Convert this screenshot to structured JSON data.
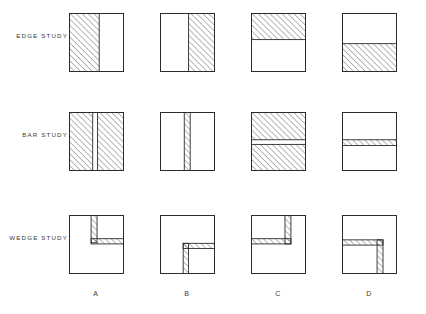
{
  "figure": {
    "title": "",
    "background_color": "#ffffff",
    "line_color": "#2b2b2b",
    "hatch_color": "#4a4a4a",
    "rows": [
      {
        "id": "edge-study",
        "label": "EDGE STUDY"
      },
      {
        "id": "bar-study",
        "label": "BAR STUDY"
      },
      {
        "id": "wedge-study",
        "label": "WEDGE STUDY"
      }
    ],
    "columns": [
      {
        "id": "a",
        "label": "A"
      },
      {
        "id": "b",
        "label": "B"
      },
      {
        "id": "c",
        "label": "C"
      },
      {
        "id": "d",
        "label": "D"
      }
    ],
    "panels": [
      {
        "row": "edge-study",
        "column": "A",
        "name": "panel-edge-study-a",
        "description": "Square with left portion hatched, vertical boundary at 55% width",
        "shapes": [
          {
            "kind": "hatched-rect",
            "x": 0,
            "y": 0,
            "w": 0.55,
            "h": 1.0
          }
        ]
      },
      {
        "row": "edge-study",
        "column": "B",
        "name": "panel-edge-study-b",
        "description": "Square with right portion hatched, vertical boundary at 52% width",
        "shapes": [
          {
            "kind": "hatched-rect",
            "x": 0.52,
            "y": 0,
            "w": 0.48,
            "h": 1.0
          }
        ]
      },
      {
        "row": "edge-study",
        "column": "C",
        "name": "panel-edge-study-c",
        "description": "Square with top portion hatched, horizontal boundary at 45% height",
        "shapes": [
          {
            "kind": "hatched-rect",
            "x": 0,
            "y": 0,
            "w": 1.0,
            "h": 0.45
          }
        ]
      },
      {
        "row": "edge-study",
        "column": "D",
        "name": "panel-edge-study-d",
        "description": "Square with bottom portion hatched, horizontal boundary at 52% height",
        "shapes": [
          {
            "kind": "hatched-rect",
            "x": 0,
            "y": 0.52,
            "w": 1.0,
            "h": 0.48
          }
        ]
      },
      {
        "row": "bar-study",
        "column": "A",
        "name": "panel-bar-study-a",
        "description": "Fully hatched square split by a narrow vertical white bar at 45% width",
        "shapes": [
          {
            "kind": "hatched-rect",
            "x": 0,
            "y": 0,
            "w": 0.43,
            "h": 1.0
          },
          {
            "kind": "hatched-rect",
            "x": 0.52,
            "y": 0,
            "w": 0.48,
            "h": 1.0
          }
        ]
      },
      {
        "row": "bar-study",
        "column": "B",
        "name": "panel-bar-study-b",
        "description": "White square with a narrow vertical hatched bar near center",
        "shapes": [
          {
            "kind": "hatched-rect",
            "x": 0.44,
            "y": 0,
            "w": 0.11,
            "h": 1.0
          }
        ]
      },
      {
        "row": "bar-study",
        "column": "C",
        "name": "panel-bar-study-c",
        "description": "Fully hatched square split by a narrow horizontal white bar at 50% height",
        "shapes": [
          {
            "kind": "hatched-rect",
            "x": 0,
            "y": 0,
            "w": 1.0,
            "h": 0.47
          },
          {
            "kind": "hatched-rect",
            "x": 0,
            "y": 0.55,
            "w": 1.0,
            "h": 0.45
          }
        ]
      },
      {
        "row": "bar-study",
        "column": "D",
        "name": "panel-bar-study-d",
        "description": "White square with a narrow horizontal hatched bar at 50% height",
        "shapes": [
          {
            "kind": "hatched-rect",
            "x": 0,
            "y": 0.47,
            "w": 1.0,
            "h": 0.1
          }
        ]
      },
      {
        "row": "wedge-study",
        "column": "A",
        "name": "panel-wedge-study-a",
        "description": "Inverted-L wedge: vertical bar from top edge down to 45%, horizontal arm extending right to right edge",
        "shapes": [
          {
            "kind": "hatched-rect",
            "x": 0.4,
            "y": 0.0,
            "w": 0.11,
            "h": 0.47
          },
          {
            "kind": "hatched-rect",
            "x": 0.4,
            "y": 0.4,
            "w": 0.6,
            "h": 0.09
          }
        ]
      },
      {
        "row": "wedge-study",
        "column": "B",
        "name": "panel-wedge-study-b",
        "description": "L wedge in lower right: horizontal arm extending right from 42%, vertical bar running down to bottom edge",
        "shapes": [
          {
            "kind": "hatched-rect",
            "x": 0.42,
            "y": 0.48,
            "w": 0.1,
            "h": 0.52
          },
          {
            "kind": "hatched-rect",
            "x": 0.42,
            "y": 0.48,
            "w": 0.58,
            "h": 0.09
          }
        ]
      },
      {
        "row": "wedge-study",
        "column": "C",
        "name": "panel-wedge-study-c",
        "description": "Wedge: vertical bar from top edge down to 47%, horizontal arm extending left to left edge",
        "shapes": [
          {
            "kind": "hatched-rect",
            "x": 0.62,
            "y": 0.0,
            "w": 0.11,
            "h": 0.49
          },
          {
            "kind": "hatched-rect",
            "x": 0.0,
            "y": 0.4,
            "w": 0.73,
            "h": 0.09
          }
        ]
      },
      {
        "row": "wedge-study",
        "column": "D",
        "name": "panel-wedge-study-d",
        "description": "Wedge: horizontal arm from left edge, vertical bar descending to bottom edge at 65%",
        "shapes": [
          {
            "kind": "hatched-rect",
            "x": 0.0,
            "y": 0.42,
            "w": 0.75,
            "h": 0.09
          },
          {
            "kind": "hatched-rect",
            "x": 0.64,
            "y": 0.42,
            "w": 0.11,
            "h": 0.58
          }
        ]
      }
    ]
  }
}
